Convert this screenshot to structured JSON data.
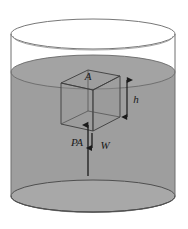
{
  "figure": {
    "labels": {
      "area": "A",
      "depth": "h",
      "pressure_force": "PA",
      "weight": "W"
    },
    "colors": {
      "fluid": "#9e9e9e",
      "fluid_surface": "#a3a3a3",
      "fluid_bottom": "#a8a8a8",
      "outline": "#5a5a5a",
      "cube_edge": "#3c3c3c",
      "arrow": "#1a1a1a",
      "background": "#ffffff"
    },
    "elements": {
      "container": "cylinder",
      "object": "cube",
      "fluid_level": "below-rim",
      "arrow_up_label": "PA",
      "arrow_down_label": "W",
      "dimension_arrow_label": "h",
      "top_face_label": "A"
    }
  }
}
